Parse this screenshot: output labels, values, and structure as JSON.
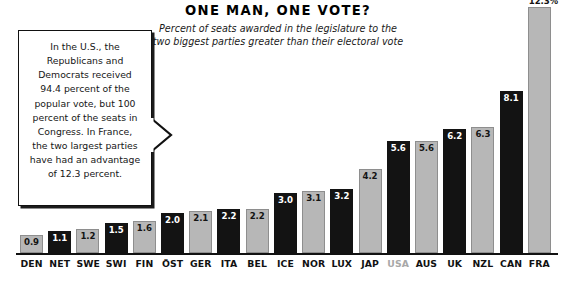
{
  "chart_data": {
    "type": "bar",
    "title": "ONE MAN, ONE VOTE?",
    "subtitle": "Percent of seats awarded in the legislature to the two biggest parties greater than their electoral vote",
    "xlabel": "",
    "ylabel": "",
    "ylim": [
      0,
      12.3
    ],
    "grid": false,
    "legend": "none",
    "categories": [
      "DEN",
      "NET",
      "SWE",
      "SWI",
      "FIN",
      "ÖST",
      "GER",
      "ITA",
      "BEL",
      "ICE",
      "NOR",
      "LUX",
      "JAP",
      "USA",
      "AUS",
      "UK",
      "NZL",
      "CAN",
      "FRA"
    ],
    "values": [
      0.9,
      1.1,
      1.2,
      1.5,
      1.6,
      2.0,
      2.1,
      2.2,
      2.2,
      3.0,
      3.1,
      3.2,
      4.2,
      5.6,
      5.6,
      6.2,
      6.3,
      8.1,
      12.3
    ],
    "value_labels": [
      "0.9",
      "1.1",
      "1.2",
      "1.5",
      "1.6",
      "2.0",
      "2.1",
      "2.2",
      "2.2",
      "3.0",
      "3.1",
      "3.2",
      "4.2",
      "5.6",
      "5.6",
      "6.2",
      "6.3",
      "8.1",
      "12.3%"
    ],
    "bar_shades": [
      "light",
      "dark",
      "light",
      "dark",
      "light",
      "dark",
      "light",
      "dark",
      "light",
      "dark",
      "light",
      "dark",
      "light",
      "dark",
      "light",
      "dark",
      "light",
      "dark",
      "light"
    ],
    "label_styles": [
      "normal",
      "normal",
      "normal",
      "normal",
      "normal",
      "normal",
      "normal",
      "normal",
      "normal",
      "normal",
      "normal",
      "normal",
      "normal",
      "muted",
      "normal",
      "normal",
      "normal",
      "normal",
      "normal"
    ],
    "value_label_placement": [
      "inside",
      "inside",
      "inside",
      "inside",
      "inside",
      "inside",
      "inside",
      "inside",
      "inside",
      "inside",
      "inside",
      "inside",
      "inside",
      "inside",
      "inside",
      "inside",
      "inside",
      "inside",
      "above"
    ]
  },
  "annotation": {
    "text": "In the U.S., the Republicans and Democrats received 94.4 percent of the popular vote, but 100 percent of the seats in Congress. In France, the two largest parties have had an advantage of 12.3 percent."
  },
  "colors": {
    "bar_dark": "#131313",
    "bar_light": "#b7b7b7",
    "bar_light_border": "#8e8e8e",
    "baseline": "#111111",
    "text": "#111111",
    "muted_label": "#a8a8a8",
    "background": "#ffffff"
  }
}
